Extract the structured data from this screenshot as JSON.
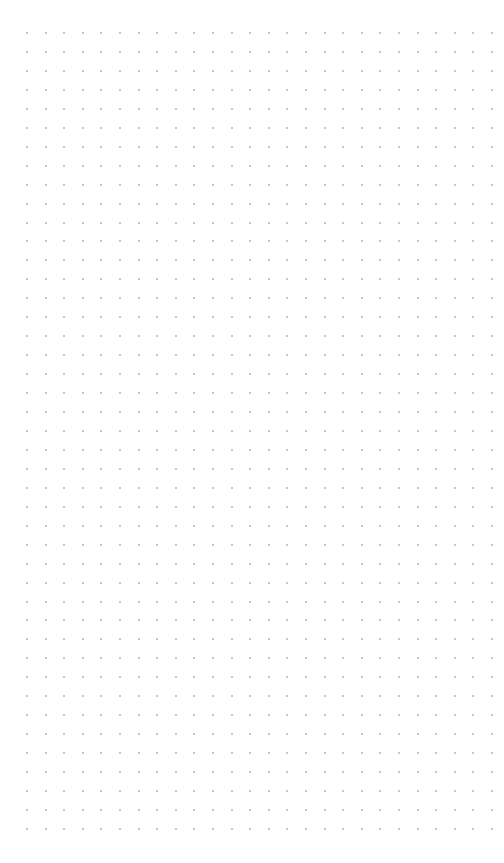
{
  "canvas": {
    "width": 504,
    "height": 863,
    "background_color": "#ffffff"
  },
  "dot_grid": {
    "dot_color": "#b4b4b4",
    "dot_size": 2,
    "columns": 26,
    "rows": 43,
    "origin_x": 27,
    "origin_y": 33,
    "spacing_x": 18.6,
    "spacing_y": 18.95
  }
}
